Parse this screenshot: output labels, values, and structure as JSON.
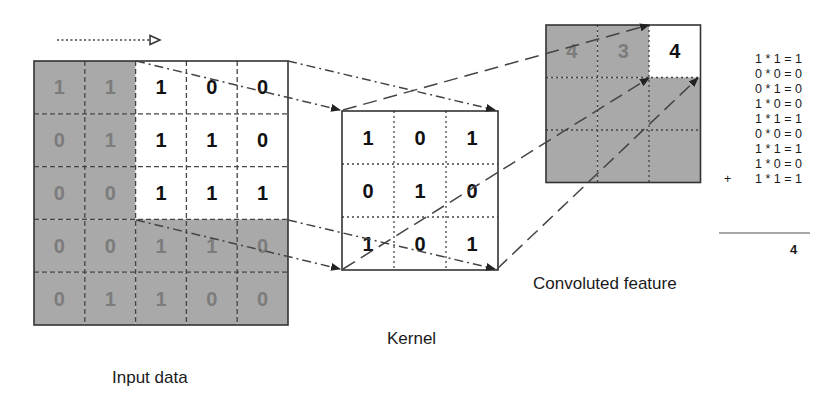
{
  "colors": {
    "shaded": "#a9a9a9",
    "shaded_text": "#7c7c7c",
    "active_text": "#111111",
    "line": "#333333",
    "white": "#ffffff"
  },
  "labels": {
    "input": "Input data",
    "kernel": "Kernel",
    "output": "Convoluted feature"
  },
  "input_grid": {
    "rows": [
      [
        "1",
        "1",
        "1",
        "0",
        "0"
      ],
      [
        "0",
        "1",
        "1",
        "1",
        "0"
      ],
      [
        "0",
        "0",
        "1",
        "1",
        "1"
      ],
      [
        "0",
        "0",
        "1",
        "1",
        "0"
      ],
      [
        "0",
        "1",
        "1",
        "0",
        "0"
      ]
    ],
    "active_window": {
      "row_start": 0,
      "col_start": 2,
      "size": 3
    }
  },
  "kernel_grid": {
    "rows": [
      [
        "1",
        "0",
        "1"
      ],
      [
        "0",
        "1",
        "0"
      ],
      [
        "1",
        "0",
        "1"
      ]
    ]
  },
  "output_grid": {
    "rows": [
      [
        "4",
        "3",
        "4"
      ],
      [
        "",
        "",
        ""
      ],
      [
        "",
        "",
        ""
      ]
    ],
    "active_cell": {
      "row": 0,
      "col": 2
    }
  },
  "calculation": {
    "lines": [
      "1 * 1 = 1",
      "0 * 0 = 0",
      "0 * 1 = 0",
      "1 * 0 = 0",
      "1 * 1 = 1",
      "0 * 0 = 0",
      "1 * 1 = 1",
      "1 * 0 = 0",
      "1 * 1 = 1"
    ],
    "operator": "+",
    "result": "4"
  },
  "stride_arrow": {
    "direction": "right"
  }
}
